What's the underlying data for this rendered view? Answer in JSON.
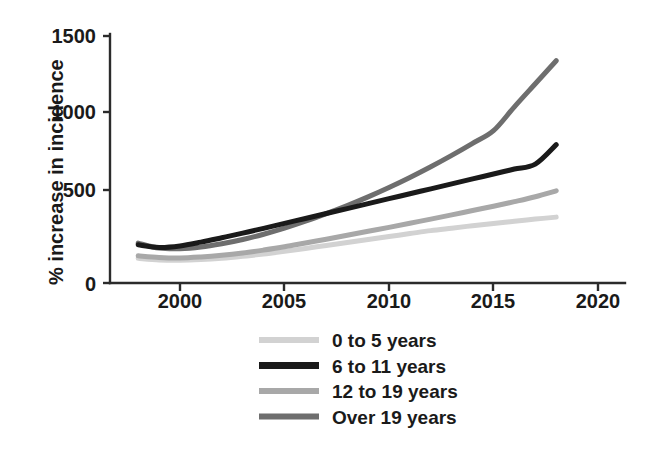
{
  "chart_data": {
    "type": "line",
    "title": "",
    "subtitle": "",
    "xlabel": "",
    "ylabel": "% increase in incidence",
    "xlim": [
      1997.8,
      2020.5
    ],
    "ylim": [
      0,
      1580
    ],
    "xticks": [
      2000,
      2005,
      2010,
      2015,
      2020
    ],
    "xtick_labels": [
      "2000",
      "2005",
      "2010",
      "2015",
      "2020"
    ],
    "yticks": [
      0,
      500,
      1000,
      1500
    ],
    "ytick_labels": [
      "0",
      "500",
      "1000",
      "1500"
    ],
    "grid": false,
    "legend_position": "below-center",
    "x": [
      1998,
      1999,
      2000,
      2001,
      2002,
      2003,
      2004,
      2005,
      2006,
      2007,
      2008,
      2009,
      2010,
      2011,
      2012,
      2013,
      2014,
      2015,
      2016,
      2017,
      2018
    ],
    "series": [
      {
        "name": "0 to 5 years",
        "color": "#d2d2d2",
        "values": [
          150,
          140,
          138,
          142,
          150,
          162,
          176,
          192,
          210,
          228,
          246,
          264,
          282,
          300,
          318,
          333,
          348,
          362,
          375,
          388,
          400
        ]
      },
      {
        "name": "6 to 11 years",
        "color": "#1a1a1a",
        "values": [
          232,
          216,
          225,
          248,
          275,
          303,
          332,
          362,
          392,
          422,
          452,
          482,
          512,
          542,
          572,
          602,
          632,
          662,
          692,
          722,
          840
        ]
      },
      {
        "name": "12 to 19 years",
        "color": "#a8a8a8",
        "values": [
          165,
          155,
          152,
          158,
          168,
          182,
          200,
          220,
          243,
          266,
          290,
          314,
          338,
          363,
          388,
          414,
          440,
          466,
          494,
          524,
          560
        ]
      },
      {
        "name": "Over 19 years",
        "color": "#6e6e6e",
        "values": [
          242,
          212,
          208,
          218,
          238,
          264,
          296,
          333,
          375,
          421,
          470,
          523,
          580,
          641,
          706,
          775,
          848,
          925,
          1070,
          1210,
          1350
        ]
      }
    ]
  },
  "legend": {
    "items": [
      {
        "label": "0 to 5 years",
        "color": "#d2d2d2"
      },
      {
        "label": "6 to 11 years",
        "color": "#1a1a1a"
      },
      {
        "label": "12 to 19 years",
        "color": "#a8a8a8"
      },
      {
        "label": "Over 19 years",
        "color": "#6e6e6e"
      }
    ]
  },
  "axes": {
    "y_title": "% increase in incidence",
    "y_tick_0": "0",
    "y_tick_1": "500",
    "y_tick_2": "1000",
    "y_tick_3": "1500",
    "x_tick_0": "2000",
    "x_tick_1": "2005",
    "x_tick_2": "2010",
    "x_tick_3": "2015",
    "x_tick_4": "2020"
  },
  "colors": {
    "axis": "#2b2b2b",
    "text": "#1a1a1a",
    "background": "#ffffff"
  }
}
